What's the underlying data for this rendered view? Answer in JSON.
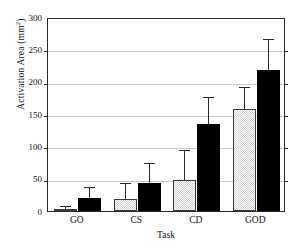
{
  "chart_data": {
    "type": "bar",
    "title": "",
    "xlabel": "Task",
    "ylabel": "Activation Area (mm",
    "ylabel_sup": "2",
    "ylabel_close": ")",
    "categories": [
      "GO",
      "CS",
      "CD",
      "GOD"
    ],
    "ylim": [
      0,
      300
    ],
    "yticks": [
      0,
      50,
      100,
      150,
      200,
      250,
      300
    ],
    "ytick_labels": [
      "0",
      "50",
      "100",
      "150",
      "200",
      "250",
      "300"
    ],
    "grid": true,
    "legend": "none",
    "series": [
      {
        "name": "gray",
        "fill": "#d2d2d2",
        "pattern": "checker",
        "values": [
          3,
          18,
          48,
          157
        ],
        "errors_upper": [
          3,
          24,
          45,
          33
        ]
      },
      {
        "name": "black",
        "fill": "#000000",
        "pattern": "solid",
        "values": [
          20,
          43,
          135,
          218
        ],
        "errors_upper": [
          15,
          29,
          40,
          47
        ]
      }
    ]
  },
  "colors": {
    "axis": "#2b2b2b",
    "grid": "#c9c9c9",
    "gray_bar": "#d2d2d2",
    "black_bar": "#000000",
    "background": "#ffffff"
  }
}
